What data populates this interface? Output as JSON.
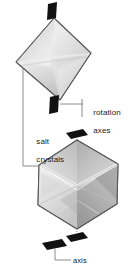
{
  "figure": {
    "background_color": "#ffffff",
    "width": 130,
    "height": 266
  },
  "labels": {
    "rotation_axes": "rotation\naxes",
    "rotation_axes_line1": "rotation",
    "rotation_axes_line2": "axes",
    "salt_crystals": "salt\ncrystals",
    "salt_crystals_line1": "salt",
    "salt_crystals_line2": "crystals",
    "axis": "axis"
  },
  "colors": {
    "text": "#1a1a1a",
    "leader_line": "#8c8c8c",
    "crystal_outline": "#555555",
    "crystal_fill_light": "#f2f2f2",
    "crystal_fill_mid": "#d4d4d4",
    "crystal_fill_dark": "#9a9a9a",
    "axis_marker": "#111111",
    "axis_line": "#666666"
  },
  "objects": {
    "top_crystal": {
      "name": "salt-crystal-diamond",
      "shape": "rotated-square",
      "description": "Light gray rotated square (diamond) salt crystal with gradient facet shading"
    },
    "bottom_crystal": {
      "name": "salt-crystal-cube",
      "shape": "isometric-hexagon-cube",
      "description": "Light gray hexagonal isometric cube salt crystal with internal X facet edges"
    },
    "axis_markers": [
      {
        "name": "axis-marker-top-upper",
        "position": "top of diamond crystal"
      },
      {
        "name": "axis-marker-top-lower",
        "position": "bottom of diamond crystal"
      },
      {
        "name": "axis-marker-bottom-upper",
        "position": "top of cube crystal"
      },
      {
        "name": "axis-marker-bottom-lower",
        "position": "bottom of cube crystal"
      },
      {
        "name": "axis-marker-legend",
        "position": "legend key at bottom"
      }
    ]
  }
}
